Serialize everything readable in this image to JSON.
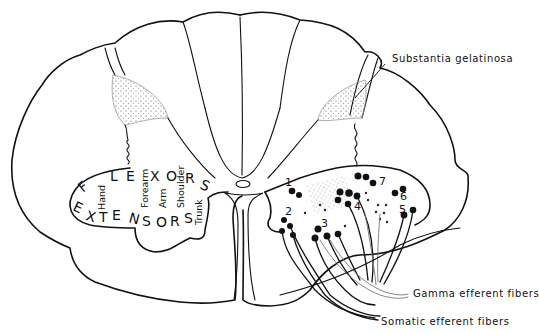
{
  "figure": {
    "labels": {
      "substantia_gelatinosa": "Substantia gelatinosa",
      "gamma_efferent": "Gamma efferent fibers",
      "somatic_efferent": "Somatic efferent fibers"
    },
    "flexors": [
      "F",
      "L",
      "E",
      "X",
      "O",
      "R",
      "S"
    ],
    "extensors": [
      "E",
      "X",
      "T",
      "E",
      "N",
      "S",
      "O",
      "R",
      "S"
    ],
    "body_regions": [
      "Hand",
      "Forearm",
      "Arm",
      "Shoulder",
      "Trunk"
    ],
    "cell_groups": [
      "1",
      "2",
      "3",
      "4",
      "5",
      "6",
      "7"
    ]
  }
}
